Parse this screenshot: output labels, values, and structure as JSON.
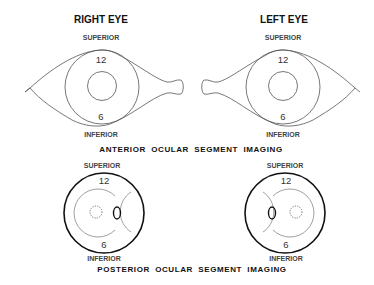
{
  "anterior": {
    "section_title": "ANTERIOR  OCULAR  SEGMENT  IMAGING",
    "right_eye": {
      "title": "RIGHT EYE",
      "superior": "SUPERIOR",
      "inferior": "INFERIOR",
      "clock_top": "12",
      "clock_bottom": "6"
    },
    "left_eye": {
      "title": "LEFT EYE",
      "superior": "SUPERIOR",
      "inferior": "INFERIOR",
      "clock_top": "12",
      "clock_bottom": "6"
    }
  },
  "posterior": {
    "section_title": "POSTERIOR  OCULAR  SEGMENT  IMAGING",
    "right_eye": {
      "superior": "SUPERIOR",
      "inferior": "INFERIOR",
      "clock_top": "12",
      "clock_bottom": "6"
    },
    "left_eye": {
      "superior": "SUPERIOR",
      "inferior": "INFERIOR",
      "clock_top": "12",
      "clock_bottom": "6"
    }
  }
}
